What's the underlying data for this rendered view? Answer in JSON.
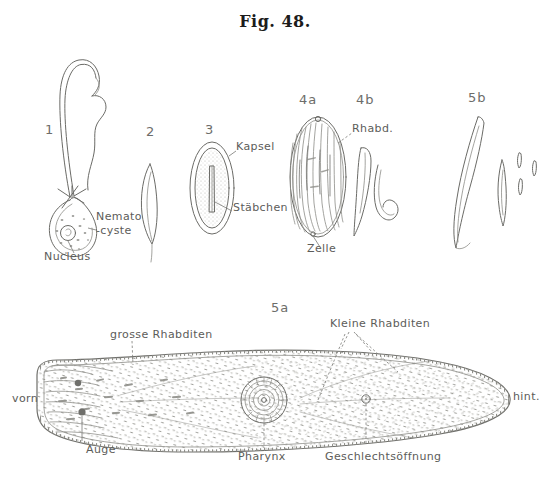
{
  "plate": {
    "title": "Fig. 48.",
    "background_color": "#ffffff",
    "ink_color": "#6b6b67",
    "label_color": "#5c5c59"
  },
  "figures": [
    {
      "id": "1",
      "number": "1",
      "caption_x": 45,
      "caption_y": 122,
      "subject": "nematocyst with extruded thread",
      "labels": [
        "Nemato",
        "-cyste",
        "Nucleus"
      ]
    },
    {
      "id": "2",
      "number": "2",
      "caption_x": 146,
      "caption_y": 124,
      "subject": "slender spindle shaped rhabdite",
      "labels": []
    },
    {
      "id": "3",
      "number": "3",
      "caption_x": 205,
      "caption_y": 122,
      "subject": "capsule containing a rodlet",
      "labels": [
        "Kapsel",
        "Stäbchen"
      ]
    },
    {
      "id": "4a",
      "number": "4a",
      "caption_x": 299,
      "caption_y": 100,
      "subject": "cell packed with rhabdites",
      "labels": [
        "Rhabd.",
        "Zelle"
      ]
    },
    {
      "id": "4b",
      "number": "4b",
      "caption_x": 356,
      "caption_y": 100,
      "subject": "two isolated rhabdites",
      "labels": []
    },
    {
      "id": "5b",
      "number": "5b",
      "caption_x": 472,
      "caption_y": 98,
      "subject": "large curved rhabdite, spindle and small rods",
      "labels": []
    },
    {
      "id": "5a",
      "number": "5a",
      "caption_x": 271,
      "caption_y": 302,
      "subject": "whole turbellarian worm in dorsal view",
      "labels": [
        "vorn",
        "hint.",
        "grosse Rhabditen",
        "Kleine Rhabditen",
        "Auge",
        "Pharynx",
        "Geschlechtsöffnung"
      ]
    }
  ],
  "callouts": {
    "nemato_line1": "Nemato",
    "nemato_line2": "-cyste",
    "nucleus": "Nucleus",
    "kapsel": "Kapsel",
    "staebchen": "Stäbchen",
    "rhabd": "Rhabd.",
    "zelle": "Zelle",
    "vorn": "vorn",
    "hint": "hint.",
    "grosse_rhabditen": "grosse Rhabditen",
    "kleine_rhabditen": "Kleine Rhabditen",
    "auge": "Auge",
    "pharynx": "Pharynx",
    "geschlechtsoeffnung": "Geschlechtsöffnung"
  }
}
